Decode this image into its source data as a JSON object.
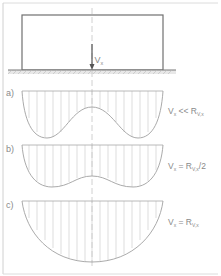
{
  "figure": {
    "load": {
      "symbol": "V",
      "subscript": "x"
    },
    "cases": [
      {
        "id": "a",
        "label": "a)",
        "condition": "Vₓ << Rᵥ,ₓ",
        "condition_parts": {
          "lhs": "V",
          "lhs_sub": "x",
          "op": "<<",
          "rhs": "R",
          "rhs_sub": "V,x"
        },
        "shape": "saddle-deep"
      },
      {
        "id": "b",
        "label": "b)",
        "condition": "Vₓ = Rᵥ,ₓ/2",
        "condition_parts": {
          "lhs": "V",
          "lhs_sub": "x",
          "op": "=",
          "rhs": "R",
          "rhs_sub": "V,x",
          "suffix": "/2"
        },
        "shape": "saddle-shallow"
      },
      {
        "id": "c",
        "label": "c)",
        "condition": "Vₓ = Rᵥ,ₓ",
        "condition_parts": {
          "lhs": "V",
          "lhs_sub": "x",
          "op": "=",
          "rhs": "R",
          "rhs_sub": "V,x"
        },
        "shape": "parabolic"
      }
    ],
    "colors": {
      "line": "#9a9a9a",
      "dark_line": "#666666",
      "text": "#8a8a8a",
      "frame": "#d0d0d0",
      "hatch": "#bdbdbd"
    }
  }
}
